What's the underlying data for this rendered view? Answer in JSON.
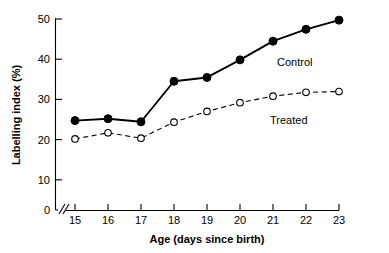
{
  "chart_data": {
    "type": "line",
    "title": "",
    "xlabel": "Age (days since birth)",
    "ylabel": "Labelling index (%)",
    "x": [
      15,
      16,
      17,
      18,
      19,
      20,
      21,
      22,
      23
    ],
    "xticklabels": [
      "15",
      "16",
      "17",
      "18",
      "19",
      "20",
      "21",
      "22",
      "23"
    ],
    "yticklabels": [
      "0",
      "10",
      "20",
      "30",
      "40",
      "50"
    ],
    "yticks": [
      0,
      10,
      20,
      30,
      40,
      50
    ],
    "xlim": [
      15,
      23
    ],
    "ylim": [
      0,
      50
    ],
    "grid": false,
    "legend_position": "inline-right",
    "axis_break": "//",
    "series": [
      {
        "name": "Control",
        "label": "Control",
        "marker": "filled-circle",
        "linestyle": "solid",
        "color": "#000000",
        "values": [
          23.4,
          23.9,
          23.1,
          33.7,
          34.7,
          39.3,
          44.2,
          47.3,
          49.7
        ]
      },
      {
        "name": "Treated",
        "label": "Treated",
        "marker": "open-circle",
        "linestyle": "dashed",
        "color": "#000000",
        "values": [
          18.6,
          20.2,
          18.8,
          23.0,
          25.8,
          28.1,
          29.8,
          30.8,
          31.0
        ]
      }
    ]
  },
  "labels": {
    "series_control": "Control",
    "series_treated": "Treated",
    "x_axis_title": "Age (days since birth)",
    "y_axis_title": "Labelling index (%)"
  }
}
